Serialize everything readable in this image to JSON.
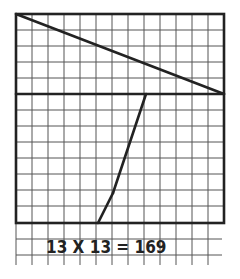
{
  "diagram": {
    "title": "",
    "grid": {
      "cols": 13,
      "rows": 13,
      "origin_x": 16,
      "origin_y": 14,
      "cell": 16
    },
    "equation": "13 X 13 = 169",
    "colors": {
      "ink": "#222222",
      "grid": "#555555",
      "background": "#ffffff"
    }
  }
}
